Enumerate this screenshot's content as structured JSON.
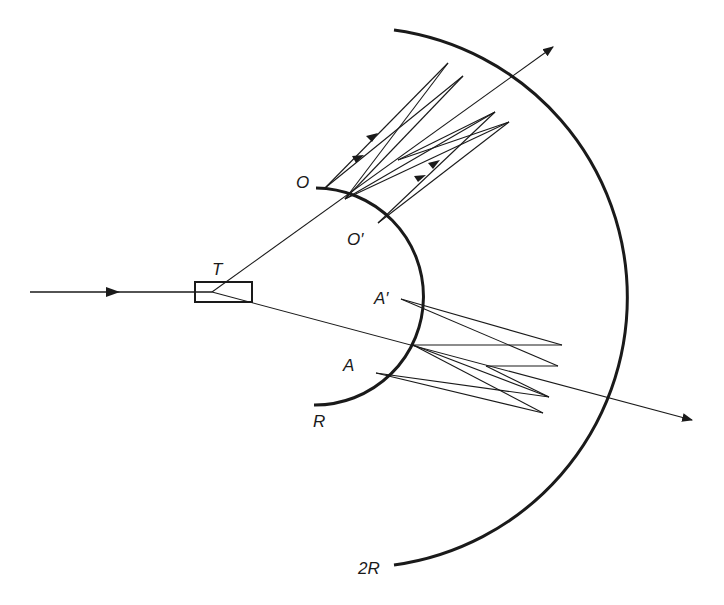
{
  "figure": {
    "type": "ray-optics diagram: concentric spherical mirrors (radii R and 2R) with beam splitter T",
    "colors": {
      "ink": "#1a1a1a",
      "background": "#ffffff"
    }
  },
  "labels": {
    "T": "T",
    "O": "O",
    "O_prime": "O′",
    "A_prime": "A′",
    "A": "A",
    "R": "R",
    "two_R": "2R"
  },
  "components": {
    "beam_splitter": {
      "label": "T",
      "x": 195,
      "y": 282,
      "w": 57,
      "h": 20
    },
    "inner_mirror": {
      "label": "R",
      "from": [
        316,
        188
      ],
      "to": [
        314,
        405
      ]
    },
    "outer_mirror": {
      "label": "2R",
      "from": [
        394,
        30
      ],
      "to": [
        394,
        565
      ]
    },
    "input_beam": {
      "from": [
        30,
        292
      ],
      "to": [
        212,
        292
      ],
      "arrow_at": [
        110,
        292
      ]
    },
    "upper_output_beam": {
      "from": [
        212,
        292
      ],
      "to": [
        553,
        47
      ]
    },
    "lower_output_beam": {
      "from": [
        212,
        292
      ],
      "to": [
        692,
        420
      ]
    }
  }
}
